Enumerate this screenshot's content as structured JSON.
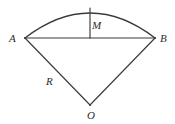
{
  "figure": {
    "type": "geometry-diagram",
    "background_color": "#ffffff",
    "stroke_color": "#3a3a3a",
    "label_color": "#2b2b2b",
    "labels": {
      "point_a": "A",
      "point_b": "B",
      "sagitta": "M",
      "radius": "R",
      "center": "O"
    },
    "points": {
      "A": {
        "x": 25,
        "y": 38
      },
      "B": {
        "x": 155,
        "y": 38
      },
      "O": {
        "x": 90,
        "y": 105
      },
      "arc_apex": {
        "x": 90,
        "y": 8
      },
      "chord_midpoint": {
        "x": 90,
        "y": 38
      }
    },
    "segments": [
      {
        "name": "chord-AB",
        "from": "A",
        "to": "B"
      },
      {
        "name": "radius-AO",
        "from": "A",
        "to": "O"
      },
      {
        "name": "radius-BO",
        "from": "B",
        "to": "O"
      },
      {
        "name": "sagitta-M",
        "from": "arc_apex",
        "to": "chord_midpoint"
      }
    ],
    "arc": {
      "name": "arc-AB",
      "from": "A",
      "to": "B",
      "apex": "arc_apex",
      "sweep": "upward"
    }
  }
}
